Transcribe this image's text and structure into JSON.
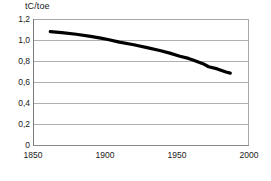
{
  "chart_data": {
    "type": "line",
    "title": "",
    "ylabel": "tC/toe",
    "xlabel": "",
    "xlim": [
      1850,
      2000
    ],
    "ylim": [
      0,
      1.2
    ],
    "grid": true,
    "legend": null,
    "y_ticks": [
      "0",
      "0,2",
      "0,4",
      "0,6",
      "0,8",
      "1,0",
      "1,2"
    ],
    "y_tick_values": [
      0,
      0.2,
      0.4,
      0.6,
      0.8,
      1.0,
      1.2
    ],
    "x_ticks": [
      "1850",
      "1900",
      "1950",
      "2000"
    ],
    "x_tick_values": [
      1850,
      1900,
      1950,
      2000
    ],
    "series": [
      {
        "name": "carbon-intensity",
        "color": "#000000",
        "line_width": 3.2,
        "x": [
          1862,
          1870,
          1880,
          1890,
          1898,
          1902,
          1910,
          1920,
          1930,
          1938,
          1945,
          1952,
          1958,
          1962,
          1968,
          1972,
          1978,
          1984,
          1987
        ],
        "values": [
          1.08,
          1.07,
          1.055,
          1.035,
          1.015,
          1.005,
          0.98,
          0.955,
          0.925,
          0.9,
          0.875,
          0.845,
          0.825,
          0.805,
          0.775,
          0.745,
          0.725,
          0.695,
          0.685
        ]
      }
    ]
  },
  "axis_title": "tC/toe"
}
